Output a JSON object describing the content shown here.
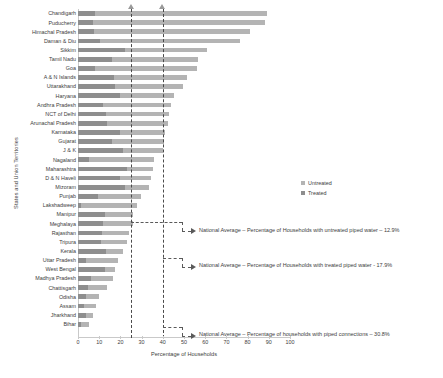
{
  "chart_data": {
    "type": "bar",
    "subtype": "stacked-horizontal",
    "title": "",
    "xlabel": "Percentage of Households",
    "ylabel": "States and Union Territories",
    "xlim": [
      0,
      100
    ],
    "xticks": [
      0,
      10,
      20,
      30,
      40,
      50,
      60,
      70,
      80,
      90,
      100
    ],
    "grid": false,
    "legend_position": "right",
    "series": [
      {
        "name": "Treated",
        "color": "#8e8e8e",
        "values": [
          8.0,
          7.0,
          7.5,
          10.5,
          22.0,
          16.0,
          8.0,
          17.0,
          17.5,
          20.0,
          12.0,
          13.0,
          13.5,
          20.0,
          16.0,
          21.0,
          5.0,
          23.0,
          20.0,
          22.0,
          9.5,
          1.5,
          12.5,
          12.0,
          11.5,
          11.0,
          13.0,
          4.0,
          12.5,
          6.0,
          4.5,
          4.0,
          3.0,
          4.0,
          1.5,
          1.5
        ]
      },
      {
        "name": "Untreated",
        "color": "#b4b4b4",
        "values": [
          81.0,
          81.0,
          73.5,
          66.0,
          39.0,
          40.5,
          48.0,
          34.5,
          32.0,
          25.5,
          32.0,
          30.0,
          29.0,
          21.0,
          24.5,
          19.0,
          31.0,
          12.5,
          14.5,
          11.5,
          20.0,
          26.5,
          13.5,
          14.0,
          12.5,
          12.0,
          8.0,
          15.0,
          5.0,
          10.5,
          9.0,
          6.0,
          5.5,
          3.0,
          3.5,
          2.0
        ]
      }
    ],
    "categories": [
      "Chandigarh",
      "Puducherry",
      "Himachal Pradesh",
      "Daman & Diu",
      "Sikkim",
      "Tamil Nadu",
      "Goa",
      "A & N Islands",
      "Uttarakhand",
      "Haryana",
      "Andhra Pradesh",
      "NCT of Delhi",
      "Arunachal Pradesh",
      "Karnataka",
      "Gujarat",
      "J & K",
      "Nagaland",
      "Maharashtra",
      "D & N Haveli",
      "Mizoram",
      "Punjab",
      "Lakshadweep",
      "Manipur",
      "Meghalaya",
      "Rajasthan",
      "Tripura",
      "Kerala",
      "Uttar Pradesh",
      "West Bengal",
      "Madhya Pradesh",
      "Chattisgarh",
      "Odisha",
      "Assam",
      "Jharkhand",
      "Bihar",
      ""
    ],
    "reference_lines": [
      {
        "name": "untreated-national-average",
        "value": 12.9
      },
      {
        "name": "treated-national-average",
        "value": 17.9
      },
      {
        "name": "piped-connections-national-average",
        "value": 30.8
      }
    ],
    "annotations": [
      {
        "name": "annotation-untreated",
        "text": "National Average – Percentage of Households with untreated piped water – 12.9%"
      },
      {
        "name": "annotation-treated",
        "text": "National Average – Percentage of Households with treated piped water - 17.9%"
      },
      {
        "name": "annotation-piped",
        "text": "National Average – Percentage of households with piped connections – 30.8%"
      }
    ]
  },
  "legend": {
    "untreated_label": "Untreated",
    "treated_label": "Treated"
  },
  "axes": {
    "x_title": "Percentage of Households",
    "y_title": "States and Union Territories"
  }
}
